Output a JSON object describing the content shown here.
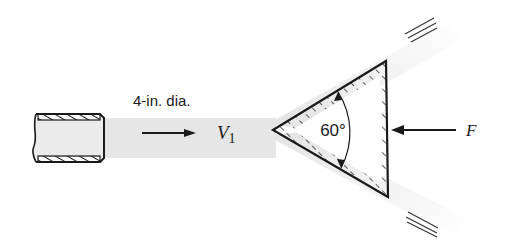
{
  "figure": {
    "type": "fluid-mechanics-diagram",
    "labels": {
      "diameter": "4-in. dia.",
      "velocity_symbol": "V",
      "velocity_subscript": "1",
      "angle": "60°",
      "force": "F"
    },
    "colors": {
      "ink": "#1a1a1a",
      "jet": "#e6e6e6",
      "background": "#ffffff"
    }
  }
}
